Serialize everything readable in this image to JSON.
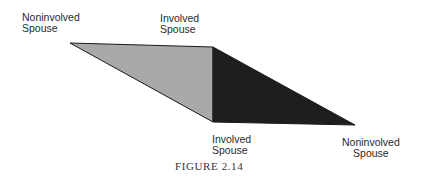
{
  "diagram": {
    "labels": {
      "top_left": [
        "Noninvolved",
        "Spouse"
      ],
      "top_center": [
        "Involved",
        "Spouse"
      ],
      "bottom_center": [
        "Involved",
        "Spouse"
      ],
      "bottom_right": [
        "Noninvolved",
        "Spouse"
      ]
    },
    "caption": "FIGURE 2.14",
    "colors": {
      "light_triangle": "#a9a9a9",
      "dark_triangle": "#1e1e1e",
      "outline": "#1a1a1a"
    },
    "shapes": [
      {
        "name": "light-triangle",
        "points": "70,43 213,47 213,122"
      },
      {
        "name": "dark-triangle",
        "points": "213,47 355,125 213,122"
      }
    ]
  }
}
